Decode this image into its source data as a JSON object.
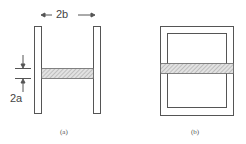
{
  "figure_a": {
    "caption": "(a)",
    "width_label": "2b",
    "thickness_label": "2a",
    "description": "Two parallel vertical plates connected by a hatched horizontal strip"
  },
  "figure_b": {
    "caption": "(b)",
    "description": "Rectangular frame (outer and inner rectangle) with hatched horizontal strip across middle"
  },
  "colors": {
    "line": "#555555",
    "hatch_fill": "#cfcfcf"
  }
}
